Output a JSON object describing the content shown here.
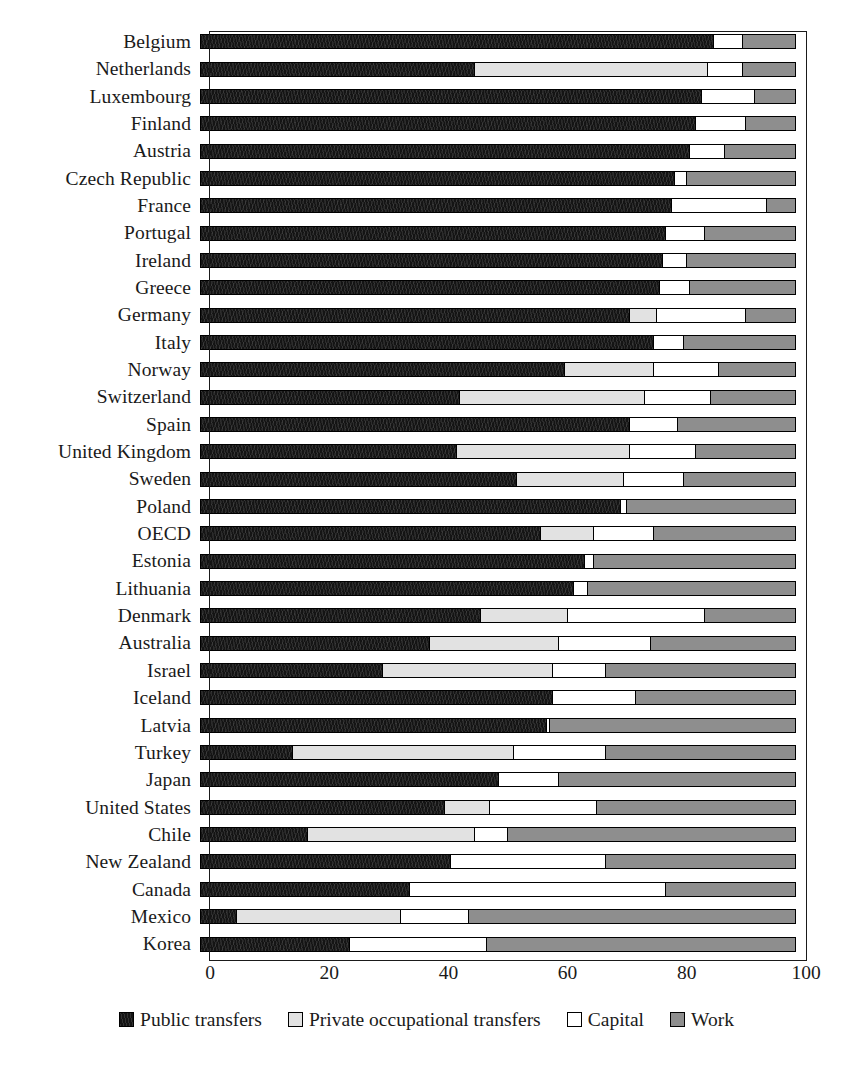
{
  "chart_data": {
    "type": "bar",
    "subtype": "horizontal-stacked-100",
    "title": "",
    "xlabel": "",
    "ylabel": "",
    "xlim": [
      0,
      100
    ],
    "xticks": [
      0,
      20,
      40,
      60,
      80,
      100
    ],
    "grid": false,
    "legend_position": "bottom",
    "series": [
      {
        "name": "Public transfers",
        "color": "#141414"
      },
      {
        "name": "Private occupational transfers",
        "color": "#e2e2e2"
      },
      {
        "name": "Capital",
        "color": "#ffffff"
      },
      {
        "name": "Work",
        "color": "#8e8e8e"
      }
    ],
    "categories": [
      "Belgium",
      "Netherlands",
      "Luxembourg",
      "Finland",
      "Austria",
      "Czech Republic",
      "France",
      "Portugal",
      "Ireland",
      "Greece",
      "Germany",
      "Italy",
      "Norway",
      "Switzerland",
      "Spain",
      "United Kingdom",
      "Sweden",
      "Poland",
      "OECD",
      "Estonia",
      "Lithuania",
      "Denmark",
      "Australia",
      "Israel",
      "Iceland",
      "Latvia",
      "Turkey",
      "Japan",
      "United States",
      "Chile",
      "New Zealand",
      "Canada",
      "Mexico",
      "Korea"
    ],
    "values": {
      "Public transfers": [
        86,
        46,
        84,
        83,
        82,
        79.5,
        79,
        78,
        77.5,
        77,
        72,
        76,
        61,
        43.5,
        72,
        43,
        53,
        70.5,
        57,
        64.5,
        62.5,
        47,
        38.5,
        30.5,
        59,
        58,
        15.5,
        50,
        41,
        18,
        42,
        35,
        6,
        25
      ],
      "Private occupational transfers": [
        0,
        39,
        0,
        0,
        0,
        0,
        0,
        0,
        0,
        0,
        4.5,
        0,
        15,
        31,
        0,
        29,
        18,
        0,
        9,
        0,
        0,
        14.5,
        21.5,
        28.5,
        0,
        0,
        37,
        0,
        7.5,
        28,
        0,
        0,
        27.5,
        0
      ],
      "Capital": [
        5,
        6,
        9,
        8.5,
        6,
        2,
        16,
        6.5,
        4,
        5,
        15,
        5,
        11,
        11,
        8,
        11,
        10,
        1,
        10,
        1.5,
        2.5,
        23,
        15.5,
        9,
        14,
        0.5,
        15.5,
        10,
        18,
        5.5,
        26,
        43,
        11.5,
        23
      ],
      "Work": [
        9,
        9,
        7,
        8.5,
        12,
        18.5,
        5,
        15.5,
        18.5,
        18,
        8.5,
        19,
        13,
        14.5,
        20,
        17,
        19,
        28.5,
        24,
        34,
        35,
        15.5,
        24.5,
        32,
        27,
        41.5,
        32,
        40,
        33.5,
        48.5,
        32,
        22,
        55,
        52
      ]
    }
  },
  "legend": {
    "items": [
      {
        "label": "Public transfers",
        "swatch": "sw-public"
      },
      {
        "label": "Private occupational transfers",
        "swatch": "sw-private"
      },
      {
        "label": "Capital",
        "swatch": "sw-capital"
      },
      {
        "label": "Work",
        "swatch": "sw-work"
      }
    ]
  },
  "axis": {
    "x_tick_labels": [
      "0",
      "20",
      "40",
      "60",
      "80",
      "100"
    ]
  }
}
